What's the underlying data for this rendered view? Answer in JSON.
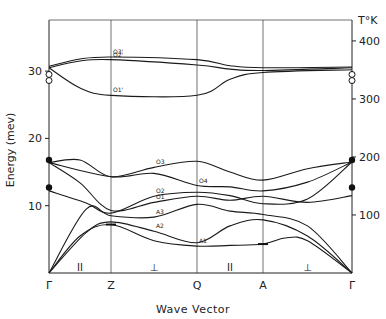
{
  "chart_data": {
    "type": "line",
    "title": "",
    "xlabel": "Wave Vector",
    "ylabel": "Energy (mev)",
    "ylabel_right": "T°K",
    "ylim": [
      0,
      40
    ],
    "grid": "vertical lines at symmetry points",
    "x_points": [
      {
        "label": "Γ",
        "x": 0
      },
      {
        "label": "Z",
        "x": 1
      },
      {
        "label": "Q",
        "x": 2
      },
      {
        "label": "A",
        "x": 3
      },
      {
        "label": "Γ",
        "x": 4
      }
    ],
    "segment_labels": [
      "II",
      "⊥",
      "II",
      "⊥"
    ],
    "yticks_left": [
      10,
      20,
      30
    ],
    "yticks_right": [
      100,
      200,
      300,
      400
    ],
    "series": [
      {
        "name": "A1",
        "points": [
          [
            0,
            0
          ],
          [
            0.5,
            5.5
          ],
          [
            1,
            7.2
          ],
          [
            1.5,
            4.8
          ],
          [
            2,
            4.0
          ],
          [
            2.5,
            4.1
          ],
          [
            3,
            4.3
          ],
          [
            3.25,
            5.2
          ],
          [
            3.5,
            4.8
          ],
          [
            4,
            0
          ]
        ]
      },
      {
        "name": "A2",
        "points": [
          [
            0,
            0
          ],
          [
            0.6,
            6.0
          ],
          [
            1,
            7.6
          ],
          [
            1.5,
            6.2
          ],
          [
            2,
            4.5
          ],
          [
            2.5,
            7.0
          ],
          [
            3,
            7.9
          ],
          [
            3.5,
            5.5
          ],
          [
            4,
            0
          ]
        ]
      },
      {
        "name": "A3",
        "points": [
          [
            0,
            0
          ],
          [
            0.6,
            9.5
          ],
          [
            1,
            8.5
          ],
          [
            1.5,
            8.3
          ],
          [
            2,
            10.2
          ],
          [
            2.5,
            9.2
          ],
          [
            3,
            8.7
          ],
          [
            3.5,
            7.0
          ],
          [
            4,
            0
          ]
        ]
      },
      {
        "name": "O1",
        "points": [
          [
            0,
            16.4
          ],
          [
            0.5,
            13.4
          ],
          [
            1,
            9.3
          ],
          [
            1.5,
            10.5
          ],
          [
            2,
            11.4
          ],
          [
            2.5,
            10.8
          ],
          [
            3,
            11.4
          ],
          [
            3.5,
            10.5
          ],
          [
            4,
            11.5
          ]
        ]
      },
      {
        "name": "O2",
        "points": [
          [
            0,
            12.2
          ],
          [
            0.6,
            10.4
          ],
          [
            1,
            8.9
          ],
          [
            1.5,
            11.4
          ],
          [
            2,
            12.0
          ],
          [
            2.5,
            11.5
          ],
          [
            3,
            10.3
          ],
          [
            3.5,
            11.0
          ],
          [
            4,
            16.5
          ]
        ]
      },
      {
        "name": "O3",
        "points": [
          [
            0,
            16.4
          ],
          [
            0.5,
            16.8
          ],
          [
            1,
            14.3
          ],
          [
            1.5,
            15.7
          ],
          [
            2,
            16.6
          ],
          [
            2.5,
            15.0
          ],
          [
            3,
            13.8
          ],
          [
            3.5,
            15.5
          ],
          [
            4,
            16.5
          ]
        ]
      },
      {
        "name": "O4",
        "points": [
          [
            0,
            16.4
          ],
          [
            1,
            14.3
          ],
          [
            1.5,
            14.8
          ],
          [
            2,
            13.0
          ],
          [
            2.5,
            12.8
          ],
          [
            3,
            12.2
          ],
          [
            3.5,
            13.5
          ],
          [
            4,
            16.5
          ]
        ]
      },
      {
        "name": "O1'",
        "points": [
          [
            0,
            30.5
          ],
          [
            0.5,
            27.5
          ],
          [
            1,
            26.4
          ],
          [
            2,
            26.4
          ],
          [
            2.5,
            28.8
          ],
          [
            3,
            29.8
          ],
          [
            4,
            30.2
          ]
        ]
      },
      {
        "name": "O2'",
        "points": [
          [
            0,
            30.5
          ],
          [
            0.5,
            31.5
          ],
          [
            1,
            31.7
          ],
          [
            2,
            30.9
          ],
          [
            2.5,
            30.3
          ],
          [
            3,
            30.1
          ],
          [
            4,
            30.5
          ]
        ]
      },
      {
        "name": "O3'",
        "points": [
          [
            0,
            30.7
          ],
          [
            0.5,
            31.8
          ],
          [
            1,
            32.1
          ],
          [
            2,
            31.7
          ],
          [
            2.5,
            30.8
          ],
          [
            3,
            30.5
          ],
          [
            4,
            30.6
          ]
        ]
      }
    ],
    "experimental_points": {
      "filled_circles_left": [
        16.8,
        12.7
      ],
      "filled_circles_right": [
        16.8,
        12.7
      ],
      "open_circles_left": [
        29.5,
        28.6
      ],
      "open_circles_right": [
        29.5,
        28.6
      ],
      "error_bars": [
        {
          "x": 1,
          "y": 7.2
        },
        {
          "x": 3,
          "y": 4.3
        }
      ]
    }
  },
  "labels": {
    "xlabel": "Wave Vector",
    "ylabel": "Energy (mev)",
    "ylabel_right": "T°K"
  }
}
